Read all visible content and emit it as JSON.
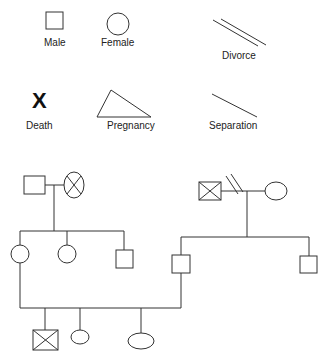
{
  "legend": {
    "male": "Male",
    "female": "Female",
    "divorce": "Divorce",
    "death_symbol": "X",
    "death": "Death",
    "pregnancy": "Pregnancy",
    "separation": "Separation"
  },
  "colors": {
    "stroke": "#333333",
    "background": "#ffffff"
  },
  "genogram": {
    "left_couple": {
      "father": "male",
      "mother": "female-deceased"
    },
    "left_children": [
      "female",
      "female",
      "male"
    ],
    "right_couple": {
      "father": "male-deceased",
      "mother": "female",
      "relationship": "divorce"
    },
    "right_children": [
      "male",
      "male"
    ],
    "third_generation": [
      "male-deceased",
      "female",
      "female"
    ]
  }
}
